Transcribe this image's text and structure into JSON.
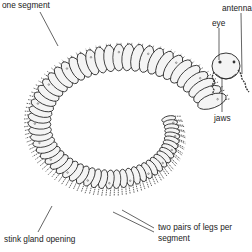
{
  "diagram": {
    "labels": {
      "one_segment": "one segment",
      "antenna": "antenna",
      "eye": "eye",
      "jaws": "jaws",
      "stink_gland": "stink gland opening",
      "legs_line1": "two pairs of legs per",
      "legs_line2": "segment"
    },
    "colors": {
      "ink": "#222222",
      "body_fill": "#f4f4f4",
      "shade": "#9a9a9a",
      "background": "#ffffff"
    }
  }
}
